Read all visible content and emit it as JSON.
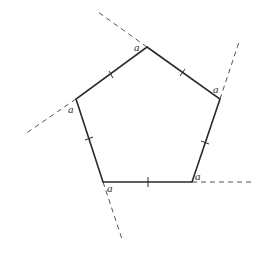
{
  "diagram": {
    "title": "",
    "shape": "regular pentagon",
    "stroke_color": "#2a2a2a",
    "dash_color": "#555555",
    "vertices": [
      {
        "name": "top",
        "x": 147,
        "y": 47
      },
      {
        "name": "right",
        "x": 220,
        "y": 99
      },
      {
        "name": "bottom-right",
        "x": 192,
        "y": 182
      },
      {
        "name": "bottom-left",
        "x": 103,
        "y": 182
      },
      {
        "name": "left",
        "x": 76,
        "y": 99
      }
    ],
    "angle_labels": [
      {
        "text": "a",
        "x": 134,
        "y": 51
      },
      {
        "text": "a",
        "x": 213,
        "y": 93
      },
      {
        "text": "a",
        "x": 195,
        "y": 180
      },
      {
        "text": "a",
        "x": 107,
        "y": 192
      },
      {
        "text": "a",
        "x": 68,
        "y": 113
      }
    ],
    "extensions": [
      {
        "from": "top",
        "x1": 147,
        "y1": 47,
        "x2": 98,
        "y2": 12
      },
      {
        "from": "right",
        "x1": 220,
        "y1": 99,
        "x2": 239,
        "y2": 42
      },
      {
        "from": "bottom-right",
        "x1": 192,
        "y1": 182,
        "x2": 255,
        "y2": 182
      },
      {
        "from": "bottom-left",
        "x1": 103,
        "y1": 182,
        "x2": 122,
        "y2": 239
      },
      {
        "from": "left",
        "x1": 76,
        "y1": 99,
        "x2": 25,
        "y2": 134
      }
    ],
    "tick_marks": [
      {
        "side": "top-left",
        "x1": 109,
        "y1": 71,
        "x2": 113,
        "y2": 78
      },
      {
        "side": "top-right",
        "x1": 185,
        "y1": 69,
        "x2": 180,
        "y2": 76
      },
      {
        "side": "right",
        "x1": 201,
        "y1": 141,
        "x2": 209,
        "y2": 144
      },
      {
        "side": "bottom",
        "x1": 148,
        "y1": 177,
        "x2": 148,
        "y2": 187
      },
      {
        "side": "left",
        "x1": 85,
        "y1": 140,
        "x2": 93,
        "y2": 137
      }
    ]
  }
}
